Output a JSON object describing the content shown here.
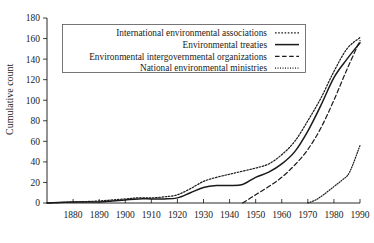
{
  "chart_data": {
    "type": "line",
    "title": "",
    "xlabel": "",
    "ylabel": "Cumulative count",
    "xlim": [
      1870,
      1990
    ],
    "ylim": [
      0,
      180
    ],
    "xticks": [
      1880,
      1890,
      1900,
      1910,
      1920,
      1930,
      1940,
      1950,
      1960,
      1970,
      1980,
      1990
    ],
    "yticks": [
      0,
      20,
      40,
      60,
      80,
      100,
      120,
      140,
      160,
      180
    ],
    "grid": false,
    "legend_position": "upper-left-inside",
    "series": [
      {
        "name": "International environmental associations",
        "style": "dotted",
        "x": [
          1870,
          1880,
          1890,
          1900,
          1905,
          1910,
          1915,
          1920,
          1925,
          1930,
          1935,
          1940,
          1945,
          1950,
          1955,
          1960,
          1965,
          1970,
          1975,
          1980,
          1985,
          1990
        ],
        "values": [
          0,
          1,
          2,
          4,
          5,
          5,
          6,
          8,
          14,
          21,
          25,
          28,
          31,
          34,
          38,
          47,
          60,
          80,
          102,
          128,
          150,
          161
        ]
      },
      {
        "name": "Environmental treaties",
        "style": "solid",
        "x": [
          1870,
          1880,
          1890,
          1895,
          1900,
          1905,
          1910,
          1915,
          1920,
          1925,
          1930,
          1935,
          1940,
          1945,
          1950,
          1955,
          1960,
          1965,
          1970,
          1975,
          1980,
          1985,
          1990
        ],
        "values": [
          0,
          1,
          1,
          2,
          3,
          4,
          4,
          4,
          5,
          10,
          15,
          17,
          17,
          18,
          25,
          30,
          38,
          50,
          70,
          95,
          122,
          140,
          156
        ]
      },
      {
        "name": "Environmental intergovernmental organizations",
        "style": "dashed",
        "x": [
          1945,
          1950,
          1955,
          1960,
          1965,
          1970,
          1975,
          1980,
          1985,
          1990
        ],
        "values": [
          0,
          8,
          16,
          25,
          37,
          52,
          73,
          100,
          130,
          158
        ]
      },
      {
        "name": "National environmental ministries",
        "style": "fine-dotted",
        "x": [
          1970,
          1973,
          1976,
          1980,
          1983,
          1986,
          1990
        ],
        "values": [
          0,
          3,
          8,
          16,
          22,
          30,
          56
        ]
      }
    ]
  },
  "legend": {
    "entries": [
      {
        "label": "International environmental associations",
        "swatch": "dotted-swatch"
      },
      {
        "label": "Environmental treaties",
        "swatch": "solid-swatch"
      },
      {
        "label": "Environmental intergovernmental organizations",
        "swatch": "dashed-swatch"
      },
      {
        "label": "National environmental ministries",
        "swatch": "fine-dotted-swatch"
      }
    ]
  },
  "axes": {
    "y_title": "Cumulative count",
    "y_tick_labels": [
      "0",
      "20",
      "40",
      "60",
      "80",
      "100",
      "120",
      "140",
      "160",
      "180"
    ],
    "x_tick_labels": [
      "1880",
      "1890",
      "1900",
      "1910",
      "1920",
      "1930",
      "1940",
      "1950",
      "1960",
      "1970",
      "1980",
      "1990"
    ]
  },
  "colors": {
    "axis": "#111111",
    "series": "#1a1a1a",
    "legend_border": "#555555",
    "background": "#ffffff"
  }
}
